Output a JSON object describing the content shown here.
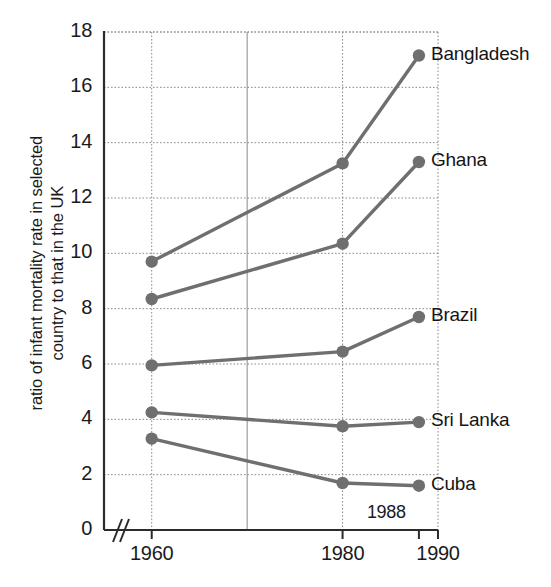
{
  "chart_data": {
    "type": "line",
    "title": "",
    "xlabel": "",
    "ylabel": "ratio of infant mortality rate in selected country to that in the UK",
    "ylabel_line1": "ratio of infant mortality rate in selected",
    "ylabel_line2": "country to that in the UK",
    "x": [
      1960,
      1980,
      1988
    ],
    "x_tick_labels": [
      "1960",
      "1980",
      "1990"
    ],
    "x_tick_values": [
      1960,
      1980,
      1990
    ],
    "extra_x_annotation": "1988",
    "xlim": [
      1955,
      1990
    ],
    "axis_break": true,
    "y_tick_labels": [
      "0",
      "2",
      "4",
      "6",
      "8",
      "10",
      "12",
      "14",
      "16",
      "18"
    ],
    "y_tick_values": [
      0,
      2,
      4,
      6,
      8,
      10,
      12,
      14,
      16,
      18
    ],
    "ylim": [
      0,
      18
    ],
    "grid": true,
    "legend": "inline-right-of-last-point",
    "line_color": "#6f6f6f",
    "marker_color": "#6f6f6f",
    "grid_color": "#8a8a8a",
    "axis_color": "#2b2b2b",
    "series": [
      {
        "name": "Bangladesh",
        "values": [
          9.7,
          13.25,
          17.15
        ]
      },
      {
        "name": "Ghana",
        "values": [
          8.35,
          10.35,
          13.3
        ]
      },
      {
        "name": "Brazil",
        "values": [
          5.95,
          6.45,
          7.7
        ]
      },
      {
        "name": "Sri Lanka",
        "values": [
          4.25,
          3.75,
          3.9
        ]
      },
      {
        "name": "Cuba",
        "values": [
          3.3,
          1.7,
          1.6
        ]
      }
    ]
  }
}
